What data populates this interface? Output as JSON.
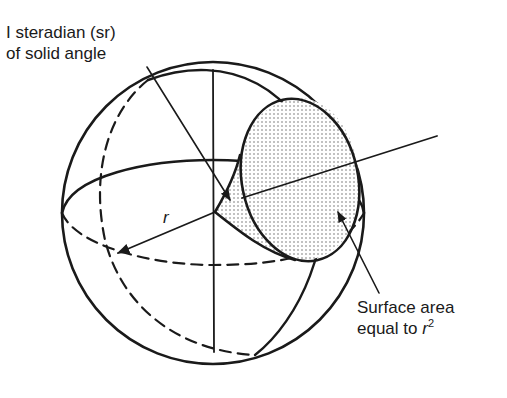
{
  "figure": {
    "type": "diagram",
    "colors": {
      "ink": "#1a1a1a",
      "background": "#ffffff",
      "shading_dots": "#555555"
    }
  },
  "labels": {
    "steradian": {
      "line1": "I steradian (sr)",
      "line2": "of solid angle"
    },
    "surface_area": {
      "line1": "Surface area",
      "line2_prefix": "equal to ",
      "symbol": "r",
      "exponent": "2"
    },
    "radius": "r"
  }
}
